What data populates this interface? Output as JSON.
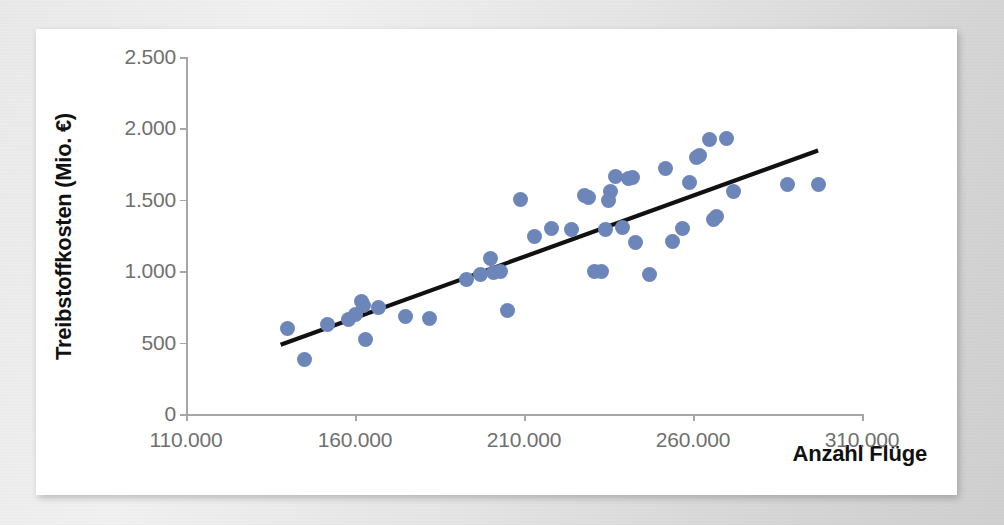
{
  "chart_data": {
    "type": "scatter",
    "title": "",
    "xlabel": "Anzahl Flüge",
    "ylabel": "Treibstoffkosten (Mio. €)",
    "xlim": [
      110000,
      310000
    ],
    "ylim": [
      0,
      2500
    ],
    "x_ticks": [
      110000,
      160000,
      210000,
      260000,
      310000
    ],
    "x_tick_labels": [
      "110.000",
      "160.000",
      "210.000",
      "260.000",
      "310.000"
    ],
    "y_ticks": [
      0,
      500,
      1000,
      1500,
      2000,
      2500
    ],
    "y_tick_labels": [
      "0",
      "500",
      "1.000",
      "1.500",
      "2.000",
      "2.500"
    ],
    "grid": false,
    "legend": "none",
    "marker_color": "#6d86ba",
    "trendline_color": "#111111",
    "series": [
      {
        "name": "Treibstoffkosten vs. Anzahl Flüge",
        "points": [
          [
            140000,
            600
          ],
          [
            145000,
            380
          ],
          [
            152000,
            625
          ],
          [
            158000,
            660
          ],
          [
            160000,
            700
          ],
          [
            162000,
            785
          ],
          [
            162500,
            760
          ],
          [
            163000,
            520
          ],
          [
            167000,
            745
          ],
          [
            175000,
            680
          ],
          [
            182000,
            670
          ],
          [
            193000,
            940
          ],
          [
            197000,
            975
          ],
          [
            200000,
            1090
          ],
          [
            201000,
            990
          ],
          [
            203000,
            1000
          ],
          [
            205000,
            725
          ],
          [
            209000,
            1500
          ],
          [
            213000,
            1245
          ],
          [
            218000,
            1300
          ],
          [
            224000,
            1295
          ],
          [
            228000,
            1530
          ],
          [
            229000,
            1515
          ],
          [
            231000,
            1000
          ],
          [
            233000,
            1000
          ],
          [
            234000,
            1290
          ],
          [
            235000,
            1495
          ],
          [
            235500,
            1555
          ],
          [
            237000,
            1665
          ],
          [
            239000,
            1305
          ],
          [
            241000,
            1650
          ],
          [
            242000,
            1655
          ],
          [
            243000,
            1200
          ],
          [
            247000,
            975
          ],
          [
            252000,
            1720
          ],
          [
            254000,
            1205
          ],
          [
            257000,
            1300
          ],
          [
            259000,
            1620
          ],
          [
            261000,
            1795
          ],
          [
            262000,
            1810
          ],
          [
            265000,
            1920
          ],
          [
            266000,
            1360
          ],
          [
            267000,
            1385
          ],
          [
            270000,
            1930
          ],
          [
            272000,
            1560
          ],
          [
            288000,
            1605
          ],
          [
            297000,
            1605
          ]
        ]
      }
    ],
    "trendline": {
      "x_start": 138000,
      "y_start": 485,
      "x_end": 297000,
      "y_end": 1845
    }
  }
}
